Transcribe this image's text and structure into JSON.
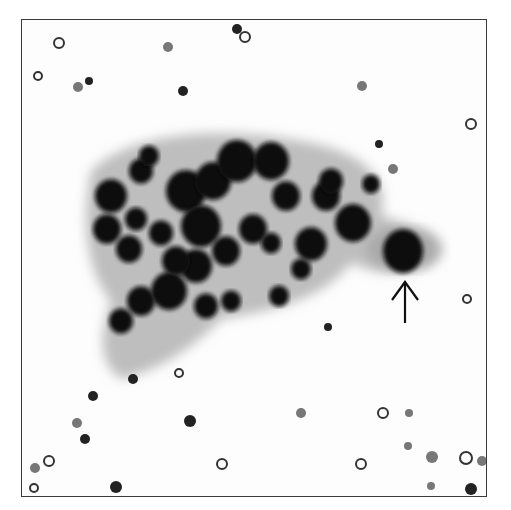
{
  "image": {
    "kind": "grayscale cytology micrograph",
    "frame": {
      "x": 21,
      "y": 19,
      "w": 466,
      "h": 478,
      "border": "#3a3a3a"
    },
    "colors": {
      "background": "#fdfdfd",
      "nucleus": "#111111",
      "cytoplasm": "#9a9a9a",
      "rbc": "#777777"
    },
    "annotation": {
      "type": "arrow",
      "direction": "up",
      "x": 404,
      "y_tip": 280,
      "y_tail": 322,
      "target": "large dark cell"
    },
    "cluster_cells": [
      [
        110,
        195,
        16
      ],
      [
        140,
        170,
        12
      ],
      [
        148,
        155,
        10
      ],
      [
        106,
        228,
        14
      ],
      [
        128,
        248,
        13
      ],
      [
        135,
        218,
        11
      ],
      [
        160,
        232,
        12
      ],
      [
        185,
        190,
        20
      ],
      [
        212,
        180,
        18
      ],
      [
        236,
        160,
        20
      ],
      [
        270,
        160,
        18
      ],
      [
        285,
        195,
        14
      ],
      [
        252,
        228,
        14
      ],
      [
        225,
        250,
        14
      ],
      [
        195,
        265,
        16
      ],
      [
        168,
        290,
        18
      ],
      [
        140,
        300,
        14
      ],
      [
        120,
        320,
        12
      ],
      [
        205,
        305,
        12
      ],
      [
        230,
        300,
        10
      ],
      [
        270,
        242,
        10
      ],
      [
        310,
        243,
        16
      ],
      [
        325,
        195,
        14
      ],
      [
        352,
        222,
        18
      ],
      [
        330,
        180,
        12
      ],
      [
        370,
        183,
        9
      ],
      [
        300,
        268,
        10
      ],
      [
        278,
        295,
        10
      ],
      [
        200,
        225,
        20
      ],
      [
        175,
        260,
        14
      ]
    ],
    "rbcs": [
      [
        58,
        42,
        5
      ],
      [
        88,
        80,
        4
      ],
      [
        77,
        86,
        5
      ],
      [
        37,
        75,
        4
      ],
      [
        167,
        46,
        5
      ],
      [
        236,
        28,
        5
      ],
      [
        244,
        36,
        5
      ],
      [
        182,
        90,
        5
      ],
      [
        361,
        85,
        5
      ],
      [
        470,
        123,
        5
      ],
      [
        392,
        168,
        5
      ],
      [
        378,
        143,
        4
      ],
      [
        466,
        298,
        4
      ],
      [
        327,
        326,
        4
      ],
      [
        300,
        412,
        5
      ],
      [
        382,
        412,
        5
      ],
      [
        408,
        412,
        4
      ],
      [
        92,
        395,
        5
      ],
      [
        48,
        460,
        5
      ],
      [
        84,
        438,
        5
      ],
      [
        76,
        422,
        5
      ],
      [
        33,
        487,
        4
      ],
      [
        34,
        467,
        5
      ],
      [
        115,
        486,
        6
      ],
      [
        221,
        463,
        5
      ],
      [
        189,
        420,
        6
      ],
      [
        431,
        456,
        6
      ],
      [
        465,
        457,
        6
      ],
      [
        481,
        460,
        5
      ],
      [
        470,
        488,
        6
      ],
      [
        178,
        372,
        4
      ],
      [
        132,
        378,
        5
      ],
      [
        407,
        445,
        4
      ],
      [
        360,
        463,
        5
      ],
      [
        430,
        485,
        4
      ]
    ]
  }
}
